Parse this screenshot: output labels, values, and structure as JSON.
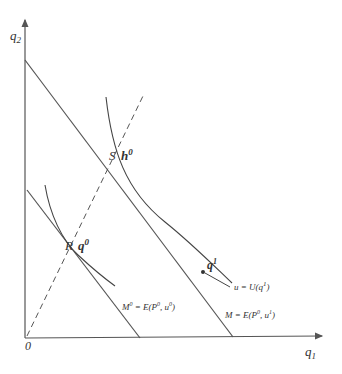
{
  "diagram": {
    "axes": {
      "x_label": "q",
      "x_sub": "1",
      "y_label": "q",
      "y_sub": "2",
      "origin_label": "0"
    },
    "points": {
      "S": {
        "label": "S",
        "tag": "h",
        "tag_sup": "0"
      },
      "R": {
        "label": "R",
        "tag": "q",
        "tag_sup": "0"
      },
      "q1": {
        "tag": "q",
        "tag_sup": "1"
      }
    },
    "budget_lines": [
      {
        "name": "M0",
        "label_lhs": "M",
        "label_lhs_sup": "0",
        "label_rhs": " = E(P",
        "label_rhs_sup": "0",
        "label_tail": ", u",
        "label_tail_sup": "0",
        "label_close": ")"
      },
      {
        "name": "M",
        "label_lhs": "M = E(P",
        "label_lhs_sup": "0",
        "label_tail": ", u",
        "label_tail_sup": "1",
        "label_close": ")"
      }
    ],
    "indifference_curve_label": {
      "text": "u = U(q",
      "sup": "1",
      "close": ")"
    },
    "colors": {
      "line": "#555555",
      "text": "#333333",
      "background": "#ffffff"
    }
  }
}
